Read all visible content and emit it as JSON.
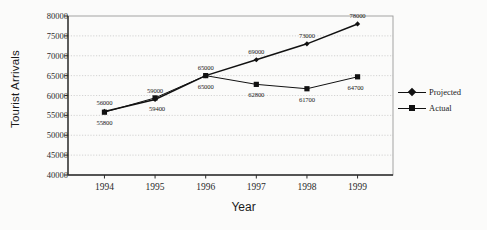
{
  "chart_data": {
    "type": "line",
    "title": "",
    "xlabel": "Year",
    "ylabel": "Tourist Arrivals",
    "categories": [
      "1994",
      "1995",
      "1996",
      "1997",
      "1998",
      "1999"
    ],
    "x": [
      1994,
      1995,
      1996,
      1997,
      1998,
      1999
    ],
    "ylim": [
      40000,
      80000
    ],
    "yticks": [
      40000,
      45000,
      50000,
      55000,
      60000,
      65000,
      70000,
      75000,
      80000
    ],
    "ytick_labels": [
      "40000",
      "45000",
      "50000",
      "55000",
      "60000",
      "65000",
      "70000",
      "75000",
      "80000"
    ],
    "grid": true,
    "legend_position": "right",
    "series": [
      {
        "name": "Projected",
        "marker": "diamond",
        "color": "#111111",
        "values": [
          56000,
          59000,
          65000,
          69000,
          73000,
          78000
        ],
        "data_labels": [
          "56000",
          "59000",
          "65000",
          "69000",
          "73000",
          "78000"
        ]
      },
      {
        "name": "Actual",
        "marker": "square",
        "color": "#111111",
        "values": [
          55800,
          59400,
          65000,
          62800,
          61700,
          64700
        ],
        "data_labels": [
          "55800",
          "59400",
          "65000",
          "62800",
          "61700",
          "64700"
        ]
      }
    ]
  },
  "legend": {
    "items": [
      {
        "label": "Projected",
        "marker": "diamond"
      },
      {
        "label": "Actual",
        "marker": "square"
      }
    ]
  },
  "axes": {
    "y_title": "Tourist Arrivals",
    "x_title": "Year"
  }
}
